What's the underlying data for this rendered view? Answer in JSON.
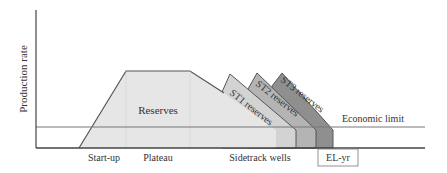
{
  "diagram": {
    "y_axis_label": "Production rate",
    "x_phase_labels": [
      "Start-up",
      "Plateau",
      "Sidetrack wells"
    ],
    "end_label": "EL-yr",
    "economic_limit_label": "Economic limit",
    "regions": [
      {
        "label": "Reserves",
        "color": "#e4e4e4"
      },
      {
        "label": "ST1 reserves",
        "color": "#d3d3d3"
      },
      {
        "label": "ST2 reserves",
        "color": "#b4b4b4"
      },
      {
        "label": "ST3 reserves",
        "color": "#8f8f8f"
      }
    ]
  }
}
